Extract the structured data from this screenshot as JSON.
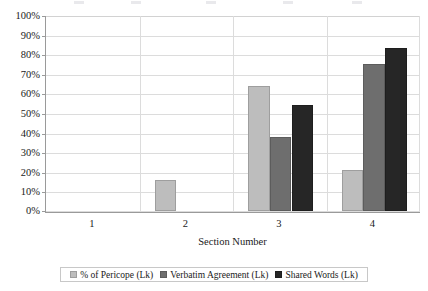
{
  "chart_data": {
    "type": "bar",
    "title": "",
    "xlabel": "Section Number",
    "ylabel": "",
    "categories": [
      "1",
      "2",
      "3",
      "4"
    ],
    "series": [
      {
        "name": "% of Pericope (Lk)",
        "color": "#bdbdbd",
        "values": [
          0,
          16,
          64,
          21
        ]
      },
      {
        "name": "Verbatim Agreement (Lk)",
        "color": "#6e6e6e",
        "values": [
          0,
          0,
          38,
          75
        ]
      },
      {
        "name": "Shared Words (Lk)",
        "color": "#262626",
        "values": [
          0,
          0,
          54,
          83
        ]
      }
    ],
    "ylim": [
      0,
      100
    ],
    "ytick_values": [
      0,
      10,
      20,
      30,
      40,
      50,
      60,
      70,
      80,
      90,
      100
    ],
    "ytick_labels": [
      "0%",
      "10%",
      "20%",
      "30%",
      "40%",
      "50%",
      "60%",
      "70%",
      "80%",
      "90%",
      "100%"
    ],
    "value_suffix": "%",
    "grid": true,
    "grid_orientation": "both",
    "legend_position": "bottom",
    "gridline_color": "#dcdcdc",
    "axis_color": "#9a9a9a",
    "background": "#ffffff"
  },
  "axes": {
    "x_title": "Section Number"
  }
}
